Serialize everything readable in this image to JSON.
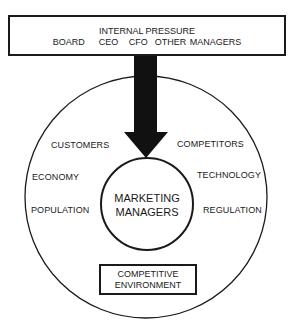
{
  "diagram": {
    "internal_pressure": {
      "title": "INTERNAL PRESSURE",
      "members": "BOARD    CEO   CFO  OTHER MANAGERS"
    },
    "center": {
      "line1": "MARKETING",
      "line2": "MANAGERS"
    },
    "external_factors": {
      "left": [
        "CUSTOMERS",
        "ECONOMY",
        "POPULATION"
      ],
      "right": [
        "COMPETITORS",
        "TECHNOLOGY",
        "REGULATION"
      ]
    },
    "environment": {
      "line1": "COMPETITIVE",
      "line2": "ENVIRONMENT"
    },
    "colors": {
      "line": "#1a1a1a",
      "background": "#ffffff"
    }
  }
}
